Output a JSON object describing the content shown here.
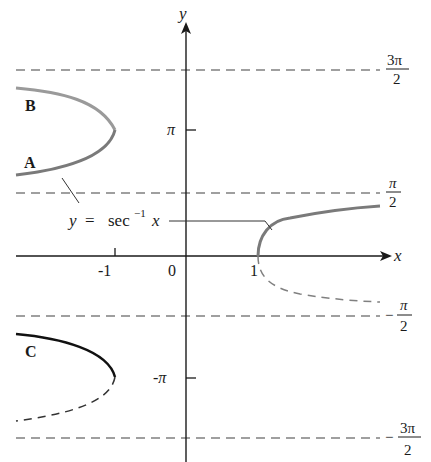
{
  "diagram": {
    "axes": {
      "x_label": "x",
      "y_label": "y",
      "x_ticks": [
        "-1",
        "0",
        "1"
      ],
      "y_ticks": [
        "π",
        "-π"
      ]
    },
    "asymptote_labels": {
      "three_pi_over_two": {
        "num": "3π",
        "den": "2",
        "sign": ""
      },
      "pi_over_two": {
        "num": "π",
        "den": "2",
        "sign": ""
      },
      "neg_pi_over_two": {
        "num": "π",
        "den": "2",
        "sign": "−"
      },
      "neg_three_pi_over_two": {
        "num": "3π",
        "den": "2",
        "sign": "−"
      }
    },
    "function_label": {
      "y": "y",
      "eq": "=",
      "sec": "sec",
      "sup": "−1",
      "x": "x"
    },
    "branch_labels": {
      "A": "A",
      "B": "B",
      "C": "C"
    },
    "colors": {
      "axis": "#1a1a1a",
      "dash": "#777777",
      "curve_gray": "#7a7a7a",
      "curve_black": "#111111"
    }
  }
}
